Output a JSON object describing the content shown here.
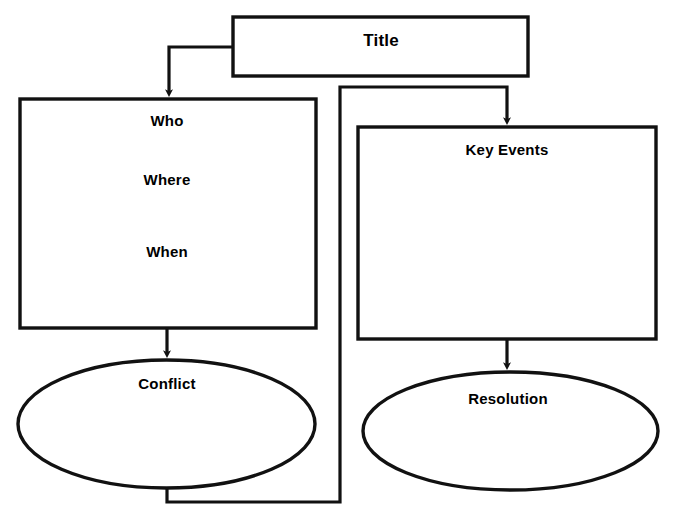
{
  "diagram": {
    "type": "story-map-graphic-organizer",
    "stroke_color": "#111111",
    "fill_color": "#ffffff",
    "nodes": [
      {
        "id": "title",
        "shape": "rectangle",
        "label": "Title"
      },
      {
        "id": "setting",
        "shape": "rectangle",
        "label_1": "Who",
        "label_2": "Where",
        "label_3": "When"
      },
      {
        "id": "key_events",
        "shape": "rectangle",
        "label": "Key Events"
      },
      {
        "id": "conflict",
        "shape": "ellipse",
        "label": "Conflict"
      },
      {
        "id": "resolution",
        "shape": "ellipse",
        "label": "Resolution"
      }
    ],
    "edges": [
      {
        "from": "title",
        "to": "setting",
        "style": "elbow-arrow"
      },
      {
        "from": "setting",
        "to": "conflict",
        "style": "straight-arrow"
      },
      {
        "from": "conflict",
        "to": "key_events",
        "style": "elbow-arrow"
      },
      {
        "from": "key_events",
        "to": "resolution",
        "style": "straight-arrow"
      }
    ]
  }
}
